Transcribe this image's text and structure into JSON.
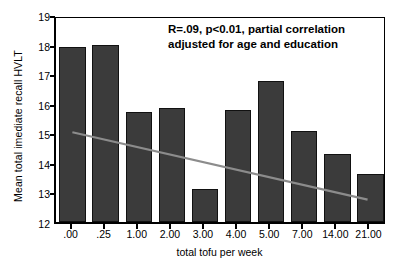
{
  "chart_data": {
    "type": "bar",
    "title": "",
    "xlabel": "total tofu per week",
    "ylabel": "Mean total imediate recall HVLT",
    "categories": [
      ".00",
      ".25",
      "1.00",
      "2.00",
      "3.00",
      "4.00",
      "5.00",
      "7.00",
      "14.00",
      "21.00"
    ],
    "values": [
      17.92,
      18.0,
      15.72,
      15.87,
      13.13,
      15.8,
      16.76,
      15.07,
      14.3,
      13.63
    ],
    "ylim": [
      12,
      19
    ],
    "yticks": [
      "12",
      "13",
      "14",
      "15",
      "16",
      "17",
      "18",
      "19"
    ],
    "ytick_values": [
      12,
      13,
      14,
      15,
      16,
      17,
      18,
      19
    ],
    "grid": false,
    "legend": "none",
    "bar_color": "#3b3b3b",
    "bar_edge_color": "#111111",
    "axis_color": "#000000",
    "background_color": "#ffffff",
    "annotations": [
      {
        "name": "statistics-note",
        "line1": "R=.09, p<0.01, partial correlation",
        "line2": "adjusted for age and education"
      }
    ],
    "trendline": {
      "name": "regression-trendline",
      "color": "#8c8c8c",
      "x_start_category": ".00",
      "x_end_category": "21.00",
      "y_start": 15.1,
      "y_end": 12.8
    }
  }
}
